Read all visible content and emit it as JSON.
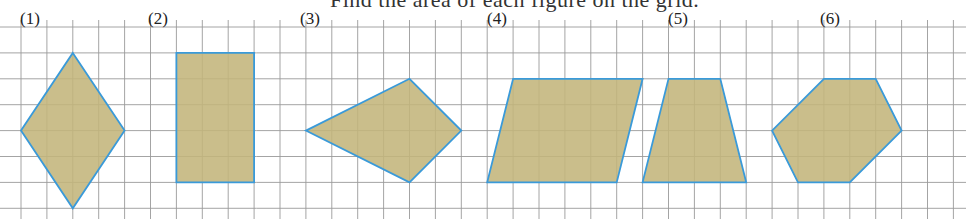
{
  "title_clipped": "Find the area of each figure on the grid.",
  "grid": {
    "origin_x": 21,
    "origin_y": 27,
    "spacing": 25.9,
    "cols_left": -1,
    "cols_right": 37,
    "rows": 8,
    "line_color": "#9a9a9a"
  },
  "style": {
    "fill": "#c3b57b",
    "stroke": "#3a9ad9"
  },
  "figures": [
    {
      "label": "(1)",
      "label_pos": [
        20,
        10
      ],
      "shape": "rhombus",
      "points": [
        [
          2,
          1
        ],
        [
          4,
          4
        ],
        [
          2,
          7
        ],
        [
          0,
          4
        ]
      ]
    },
    {
      "label": "(2)",
      "label_pos": [
        148,
        10
      ],
      "shape": "rectangle",
      "points": [
        [
          6,
          1
        ],
        [
          9,
          1
        ],
        [
          9,
          6
        ],
        [
          6,
          6
        ]
      ]
    },
    {
      "label": "(3)",
      "label_pos": [
        300,
        10
      ],
      "shape": "kite",
      "points": [
        [
          11,
          4
        ],
        [
          15,
          2
        ],
        [
          17,
          4
        ],
        [
          15,
          6
        ]
      ]
    },
    {
      "label": "(4)",
      "label_pos": [
        487,
        10
      ],
      "shape": "parallelogram",
      "points": [
        [
          19,
          2
        ],
        [
          24,
          2
        ],
        [
          23,
          6
        ],
        [
          18,
          6
        ]
      ]
    },
    {
      "label": "(5)",
      "label_pos": [
        668,
        10
      ],
      "shape": "trapezoid",
      "points": [
        [
          25,
          2
        ],
        [
          27,
          2
        ],
        [
          28,
          6
        ],
        [
          24,
          6
        ]
      ]
    },
    {
      "label": "(6)",
      "label_pos": [
        820,
        10
      ],
      "shape": "hexagon",
      "points": [
        [
          31,
          2
        ],
        [
          33,
          2
        ],
        [
          34,
          4
        ],
        [
          32,
          6
        ],
        [
          30,
          6
        ],
        [
          29,
          4
        ]
      ]
    }
  ]
}
